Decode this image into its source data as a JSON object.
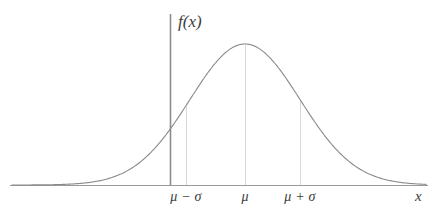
{
  "figure": {
    "kind": "normal-distribution-curve",
    "background_color": "#ffffff"
  },
  "labels": {
    "y_axis": "f(x)",
    "x_axis": "x",
    "tick_mu_minus_sigma": "μ − σ",
    "tick_mu": "μ",
    "tick_mu_plus_sigma": "μ + σ"
  },
  "colors": {
    "curve": "#8a8a8a",
    "x_axis": "#9a9a9a",
    "y_axis": "#8c8c8c",
    "dropline": "#d8d8d8",
    "text": "#3c3c3c"
  },
  "chart_data": {
    "type": "line",
    "title": "",
    "xlabel": "x",
    "ylabel": "f(x)",
    "grid": false,
    "legend": "none",
    "annotations": [
      {
        "label": "μ − σ",
        "x_px": 186,
        "z": -1,
        "dropline": true
      },
      {
        "label": "μ",
        "x_px": 245,
        "z": 0,
        "dropline": true
      },
      {
        "label": "μ + σ",
        "x_px": 300,
        "z": 1,
        "dropline": true
      }
    ],
    "axes_px": {
      "x_axis_y": 185,
      "x_axis_x0": 10,
      "x_axis_x1": 428,
      "y_axis_x": 170,
      "y_axis_y0": 14,
      "y_axis_y1": 185
    },
    "curve_px": {
      "peak_x": 245,
      "peak_y": 44,
      "baseline_y": 185,
      "sigma_px": 55,
      "amplitude_px": 141,
      "x_start": 12,
      "x_end": 426
    },
    "x": [
      -4.25,
      -4,
      -3.75,
      -3.5,
      -3.25,
      -3,
      -2.75,
      -2.5,
      -2.25,
      -2,
      -1.75,
      -1.5,
      -1.25,
      -1,
      -0.75,
      -0.5,
      -0.25,
      0,
      0.25,
      0.5,
      0.75,
      1,
      1.25,
      1.5,
      1.75,
      2,
      2.25,
      2.5,
      2.75,
      3,
      3.25,
      3.5,
      3.75,
      4,
      4.25
    ],
    "y": [
      0.0001,
      0.0003,
      0.0009,
      0.0022,
      0.0051,
      0.0111,
      0.0228,
      0.0439,
      0.0796,
      0.1353,
      0.2163,
      0.3247,
      0.4578,
      0.6065,
      0.7548,
      0.8825,
      0.9692,
      1.0,
      0.9692,
      0.8825,
      0.7548,
      0.6065,
      0.4578,
      0.3247,
      0.2163,
      0.1353,
      0.0796,
      0.0439,
      0.0228,
      0.0111,
      0.0051,
      0.0022,
      0.0009,
      0.0003,
      0.0001
    ],
    "xlim": [
      -4.25,
      4.25
    ],
    "ylim": [
      0,
      1.0
    ],
    "xtick_values": [
      -1,
      0,
      1
    ],
    "xtick_labels": [
      "μ − σ",
      "μ",
      "μ + σ"
    ]
  }
}
